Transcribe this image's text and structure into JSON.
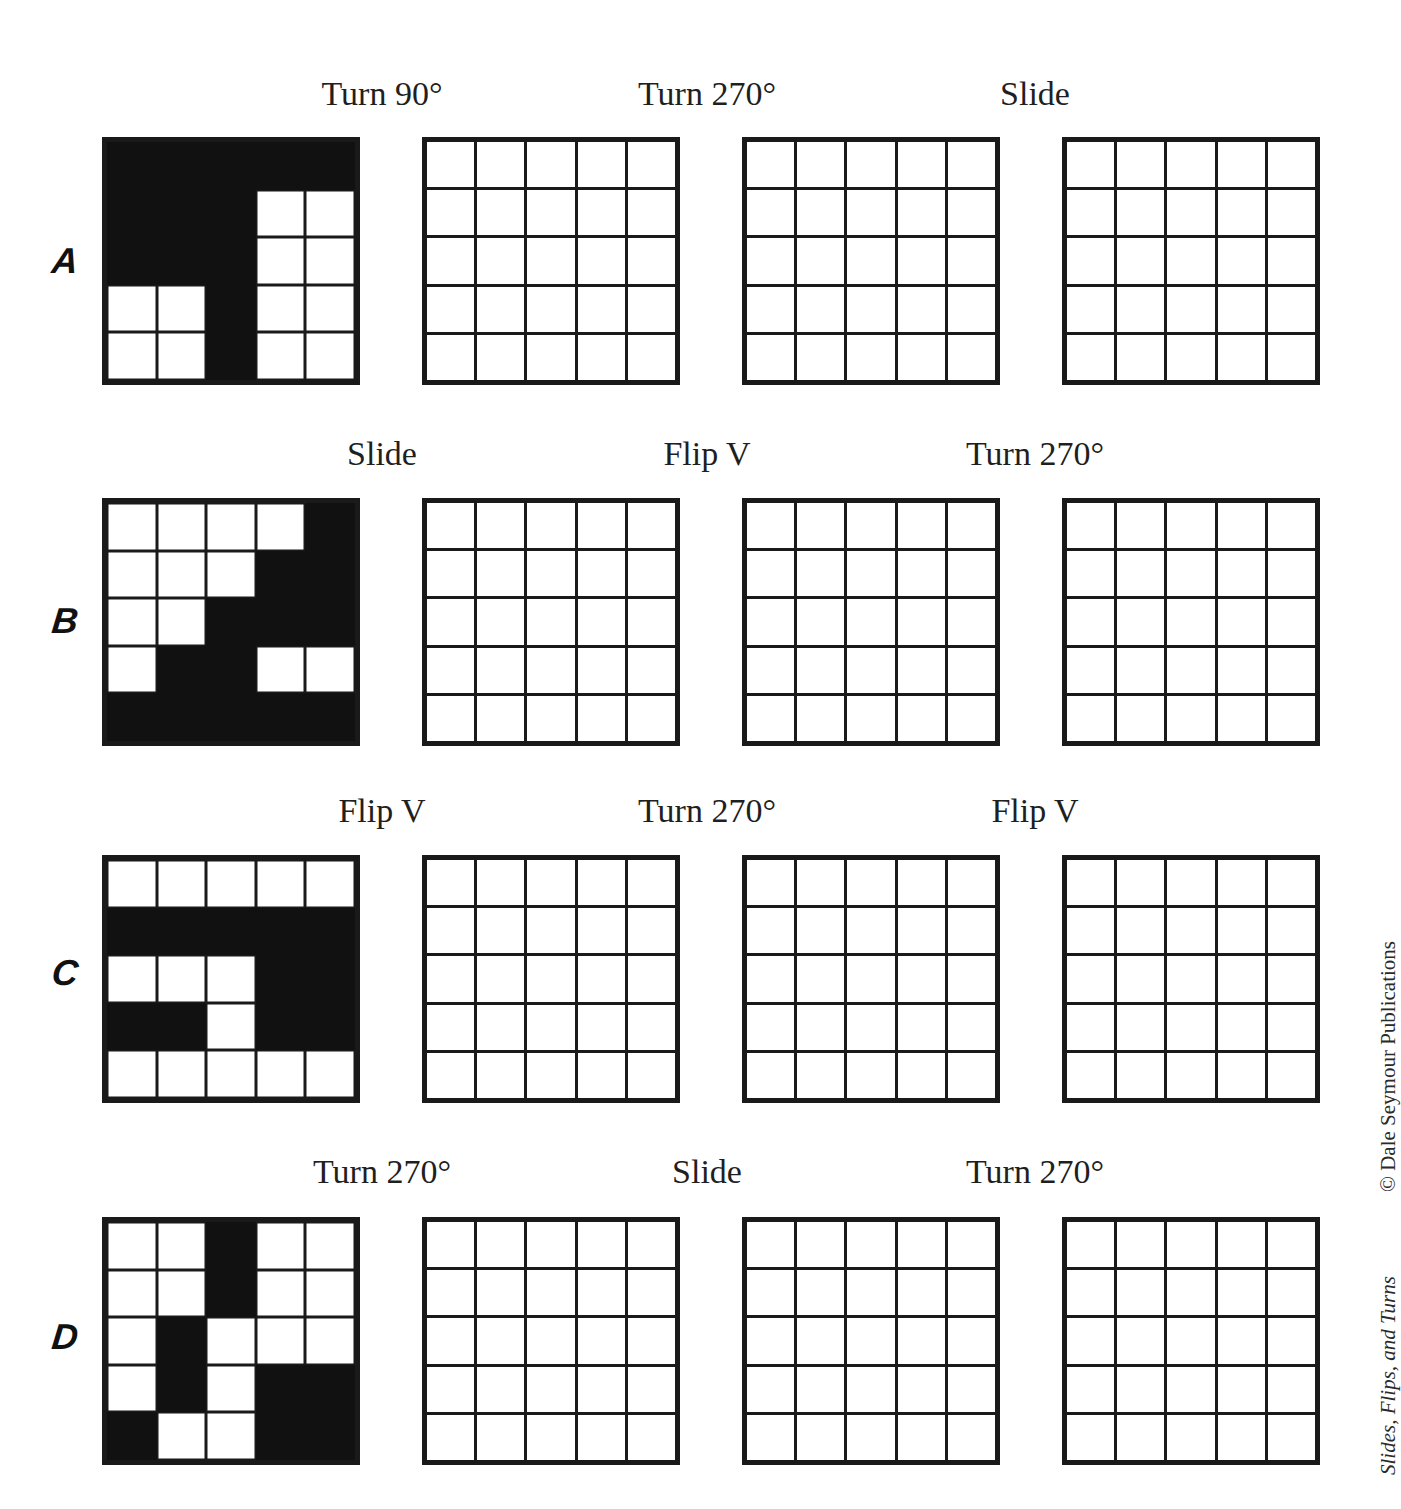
{
  "rows": [
    {
      "letter": "A",
      "steps": [
        "Turn 90°",
        "Turn 270°",
        "Slide"
      ],
      "pattern": [
        [
          1,
          1,
          1,
          1,
          1
        ],
        [
          1,
          1,
          1,
          0,
          0
        ],
        [
          1,
          1,
          1,
          0,
          0
        ],
        [
          0,
          0,
          1,
          0,
          0
        ],
        [
          0,
          0,
          1,
          0,
          0
        ]
      ]
    },
    {
      "letter": "B",
      "steps": [
        "Slide",
        "Flip V",
        "Turn 270°"
      ],
      "pattern": [
        [
          0,
          0,
          0,
          0,
          1
        ],
        [
          0,
          0,
          0,
          1,
          1
        ],
        [
          0,
          0,
          1,
          1,
          1
        ],
        [
          0,
          1,
          1,
          0,
          0
        ],
        [
          1,
          1,
          1,
          1,
          1
        ]
      ]
    },
    {
      "letter": "C",
      "steps": [
        "Flip V",
        "Turn 270°",
        "Flip V"
      ],
      "pattern": [
        [
          0,
          0,
          0,
          0,
          0
        ],
        [
          1,
          1,
          1,
          1,
          1
        ],
        [
          0,
          0,
          0,
          1,
          1
        ],
        [
          1,
          1,
          0,
          1,
          1
        ],
        [
          0,
          0,
          0,
          0,
          0
        ]
      ]
    },
    {
      "letter": "D",
      "steps": [
        "Turn 270°",
        "Slide",
        "Turn 270°"
      ],
      "pattern": [
        [
          0,
          0,
          1,
          0,
          0
        ],
        [
          0,
          0,
          1,
          0,
          0
        ],
        [
          0,
          1,
          0,
          0,
          0
        ],
        [
          0,
          1,
          0,
          1,
          1
        ],
        [
          1,
          0,
          0,
          1,
          1
        ]
      ]
    }
  ],
  "side_text": {
    "copyright": "© Dale Seymour Publications",
    "title": "Slides, Flips, and Turns"
  }
}
